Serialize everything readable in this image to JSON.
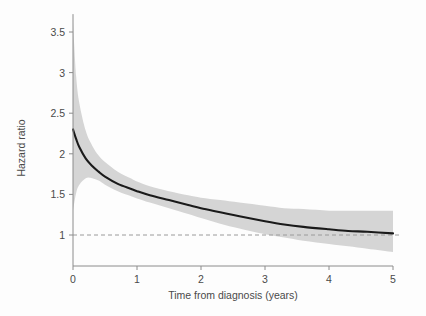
{
  "chart_data": {
    "type": "line",
    "title": "",
    "xlabel": "Time from diagnosis (years)",
    "ylabel": "Hazard ratio",
    "xlim": [
      -0.05,
      5.0
    ],
    "ylim": [
      0.62,
      3.72
    ],
    "grid": false,
    "legend": null,
    "xticks": [
      0,
      1,
      2,
      3,
      4,
      5
    ],
    "xtick_labels": [
      "0",
      "1",
      "2",
      "3",
      "4",
      "5"
    ],
    "yticks": [
      1,
      1.5,
      2,
      2.5,
      3,
      3.5
    ],
    "ytick_labels": [
      "1",
      "1.5",
      "2",
      "2.5",
      "3",
      "3.5"
    ],
    "reference_line": {
      "y": 1,
      "style": "dashed",
      "color": "#9a9a9a"
    },
    "colors": {
      "line": "#1a1a1a",
      "band": "#d5d5d5",
      "axis": "#8c8c8c",
      "text": "#4a4a4a",
      "background": "#fdfdfd"
    },
    "x": [
      0.0,
      0.05,
      0.1,
      0.2,
      0.3,
      0.4,
      0.5,
      0.7,
      0.9,
      1.0,
      1.2,
      1.5,
      1.8,
      2.0,
      2.3,
      2.6,
      3.0,
      3.3,
      3.6,
      4.0,
      4.3,
      4.6,
      5.0
    ],
    "series": [
      {
        "name": "Hazard ratio",
        "values": [
          2.3,
          2.18,
          2.08,
          1.94,
          1.85,
          1.78,
          1.72,
          1.63,
          1.57,
          1.54,
          1.49,
          1.43,
          1.37,
          1.33,
          1.28,
          1.23,
          1.17,
          1.13,
          1.1,
          1.07,
          1.05,
          1.04,
          1.02
        ],
        "ci_lower": [
          1.3,
          1.52,
          1.62,
          1.7,
          1.7,
          1.67,
          1.62,
          1.54,
          1.48,
          1.45,
          1.4,
          1.33,
          1.26,
          1.21,
          1.14,
          1.08,
          1.01,
          0.97,
          0.93,
          0.89,
          0.86,
          0.83,
          0.79
        ],
        "ci_upper": [
          3.62,
          2.95,
          2.62,
          2.28,
          2.1,
          1.98,
          1.9,
          1.78,
          1.7,
          1.66,
          1.6,
          1.54,
          1.49,
          1.46,
          1.43,
          1.4,
          1.36,
          1.33,
          1.32,
          1.3,
          1.3,
          1.3,
          1.3
        ]
      }
    ]
  }
}
